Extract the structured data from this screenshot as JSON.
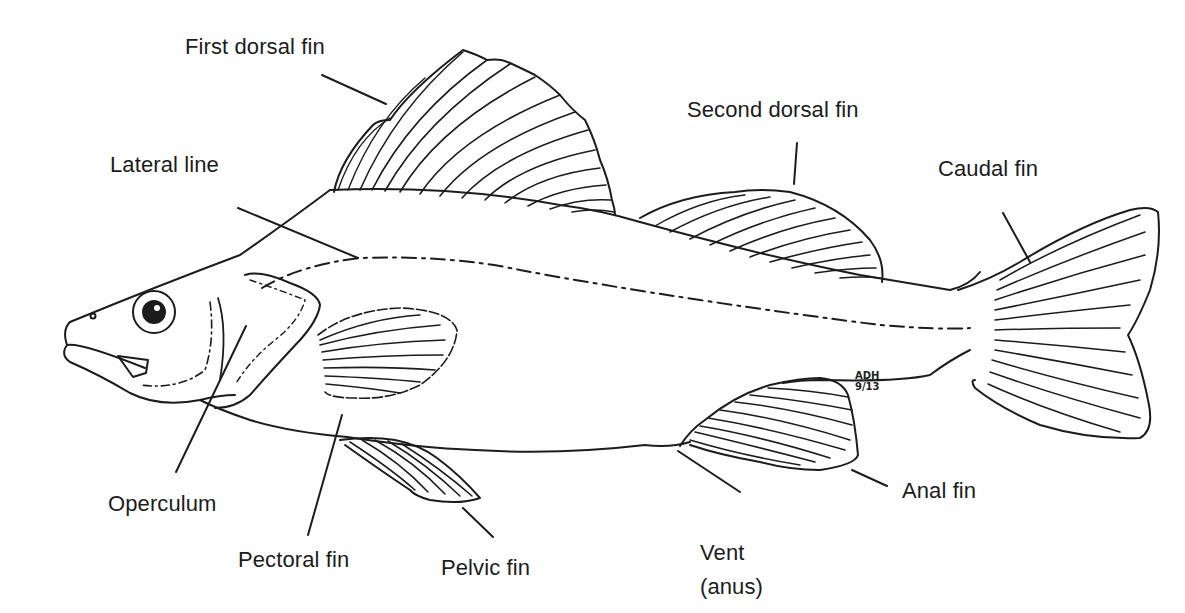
{
  "figure": {
    "labels": {
      "first_dorsal_fin": "First dorsal fin",
      "second_dorsal_fin": "Second dorsal fin",
      "lateral_line": "Lateral line",
      "caudal_fin": "Caudal fin",
      "operculum": "Operculum",
      "pectoral_fin": "Pectoral fin",
      "pelvic_fin": "Pelvic fin",
      "anal_fin": "Anal fin",
      "vent": {
        "line1": "Vent",
        "line2": "(anus)"
      }
    },
    "signature": {
      "initials": "ADH",
      "date": "9/13"
    },
    "colors": {
      "ink": "#1c1c1c",
      "background": "#ffffff"
    }
  }
}
